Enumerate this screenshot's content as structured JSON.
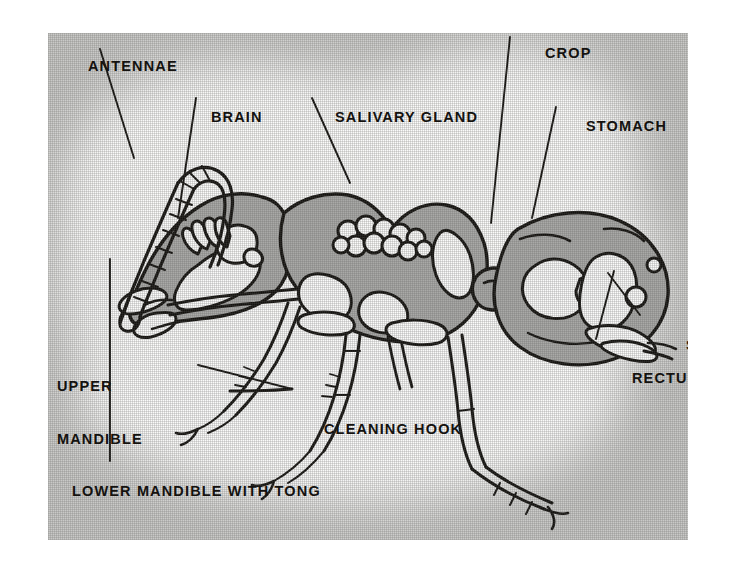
{
  "figure": {
    "panel": {
      "background_color": "#c9c9c7",
      "highlight_color": "#fbfbfa",
      "ink_color": "#14120f",
      "organ_fill_color": "#a8a8a6"
    }
  },
  "labels": {
    "antennae": "ANTENNAE",
    "brain": "BRAIN",
    "salivary_gland": "SALIVARY GLAND",
    "crop": "CROP",
    "stomach": "STOMACH",
    "upper_mandible_line1": "UPPER",
    "upper_mandible_line2": "MANDIBLE",
    "cleaning_hook": "CLEANING HOOK",
    "sting": "STING",
    "rectum": "RECTUM",
    "lower_mandible": "LOWER MANDIBLE WITH TONG"
  },
  "callouts": [
    {
      "name": "antennae",
      "text": "ANTENNAE",
      "label_xy": [
        40,
        25
      ],
      "leader_from": [
        100,
        46
      ],
      "leader_to": [
        133,
        145
      ]
    },
    {
      "name": "brain",
      "text": "BRAIN",
      "label_xy": [
        163,
        76
      ],
      "leader_from": [
        196,
        97
      ],
      "leader_to": [
        178,
        215
      ]
    },
    {
      "name": "salivary-gland",
      "text": "SALIVARY GLAND",
      "label_xy": [
        287,
        76
      ],
      "leader_from": [
        312,
        97
      ],
      "leader_to": [
        349,
        180
      ]
    },
    {
      "name": "crop",
      "text": "CROP",
      "label_xy": [
        497,
        12
      ],
      "leader_from": [
        509,
        33
      ],
      "leader_to": [
        492,
        217
      ]
    },
    {
      "name": "stomach",
      "text": "STOMACH",
      "label_xy": [
        538,
        85
      ],
      "leader_from": [
        556,
        106
      ],
      "leader_to": [
        533,
        215
      ]
    },
    {
      "name": "upper-mandible",
      "text": "UPPER MANDIBLE",
      "label_xy": [
        9,
        310
      ],
      "leader_from": [
        107,
        306
      ],
      "leader_to": [
        120,
        262
      ]
    },
    {
      "name": "cleaning-hook",
      "text": "CLEANING HOOK",
      "label_xy": [
        276,
        388
      ],
      "leader_from": [
        276,
        382
      ],
      "leader_to": [
        182,
        358
      ]
    },
    {
      "name": "sting",
      "text": "STING",
      "label_xy": [
        638,
        304
      ],
      "leader_from": [
        636,
        311
      ],
      "leader_to": [
        604,
        272
      ]
    },
    {
      "name": "rectum",
      "text": "RECTUM",
      "label_xy": [
        584,
        337
      ],
      "leader_from": [
        592,
        334
      ],
      "leader_to": [
        608,
        268
      ]
    },
    {
      "name": "lower-mandible",
      "text": "LOWER MANDIBLE WITH TONG",
      "label_xy": [
        24,
        450
      ],
      "leader_from": [
        107,
        446
      ],
      "leader_to": [
        107,
        258
      ]
    }
  ],
  "anatomy_parts": [
    "antennae",
    "brain",
    "salivary gland",
    "crop",
    "stomach",
    "upper mandible",
    "lower mandible with tong",
    "cleaning hook",
    "sting",
    "rectum"
  ]
}
